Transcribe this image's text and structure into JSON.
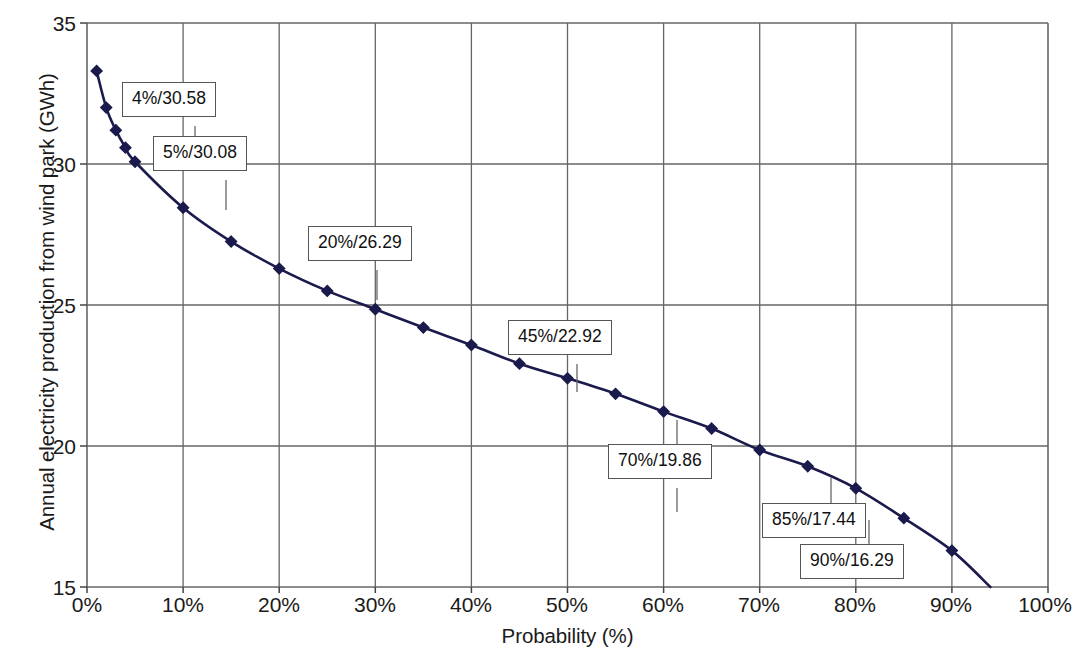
{
  "chart_data": {
    "type": "line",
    "title": "",
    "xlabel": "Probability (%)",
    "ylabel": "Annual electricity production from wind park (GWh)",
    "xlim": [
      0,
      100
    ],
    "ylim": [
      15,
      35
    ],
    "grid": true,
    "legend": null,
    "x_ticks": [
      "0%",
      "10%",
      "20%",
      "30%",
      "40%",
      "50%",
      "60%",
      "70%",
      "80%",
      "90%",
      "100%"
    ],
    "x_tick_values": [
      0,
      10,
      20,
      30,
      40,
      50,
      60,
      70,
      80,
      90,
      100
    ],
    "y_ticks": [
      "15",
      "20",
      "25",
      "30",
      "35"
    ],
    "y_tick_values": [
      15,
      20,
      25,
      30,
      35
    ],
    "series": [
      {
        "name": "Annual electricity production",
        "marker": "diamond",
        "color": "#1a1a4d",
        "x": [
          1,
          2,
          3,
          4,
          5,
          10,
          15,
          20,
          25,
          30,
          35,
          40,
          45,
          50,
          55,
          60,
          65,
          70,
          75,
          80,
          85,
          90,
          94
        ],
        "y": [
          33.3,
          32.0,
          31.2,
          30.58,
          30.08,
          28.45,
          27.25,
          26.29,
          25.5,
          24.85,
          24.2,
          23.58,
          22.92,
          22.4,
          21.85,
          21.22,
          20.62,
          19.86,
          19.28,
          18.5,
          17.44,
          16.29,
          15.0
        ]
      }
    ],
    "annotations": [
      {
        "label": "4%/30.58",
        "x": 4,
        "y": 30.58
      },
      {
        "label": "5%/30.08",
        "x": 5,
        "y": 30.08
      },
      {
        "label": "20%/26.29",
        "x": 20,
        "y": 26.29
      },
      {
        "label": "45%/22.92",
        "x": 45,
        "y": 22.92
      },
      {
        "label": "70%/19.86",
        "x": 70,
        "y": 19.86
      },
      {
        "label": "85%/17.44",
        "x": 85,
        "y": 17.44
      },
      {
        "label": "90%/16.29",
        "x": 90,
        "y": 16.29
      }
    ],
    "colors": {
      "series": "#1a1a4d",
      "grid": "#666666",
      "axis": "#444444",
      "background": "#ffffff",
      "callout_border": "#555555"
    }
  },
  "axes": {
    "y_title": "Annual electricity production from wind park (GWh)",
    "x_title": "Probability (%)",
    "y_tick_labels": [
      "35",
      "30",
      "25",
      "20",
      "15"
    ],
    "x_tick_labels": [
      "0%",
      "10%",
      "20%",
      "30%",
      "40%",
      "50%",
      "60%",
      "70%",
      "80%",
      "90%",
      "100%"
    ]
  },
  "callouts": [
    "4%/30.58",
    "5%/30.08",
    "20%/26.29",
    "45%/22.92",
    "70%/19.86",
    "85%/17.44",
    "90%/16.29"
  ]
}
